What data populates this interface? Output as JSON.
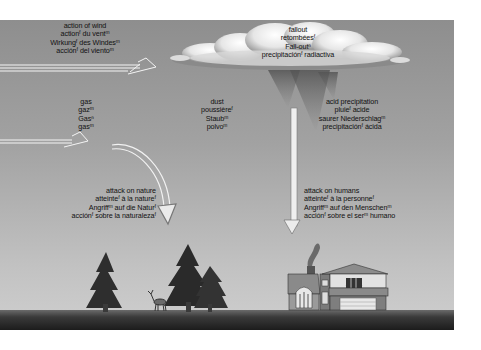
{
  "scene": {
    "colors": {
      "sky_top": "#8e8e8e",
      "sky_bottom": "#cbcbcb",
      "ground": "#2b2b2b",
      "text": "#111111"
    }
  },
  "labels": {
    "action_of_wind": [
      "action of wind",
      "actionᶠ du ventᵐ",
      "Wirkungᶠ des Windesᵐ",
      "acciónᶠ del vientoᵐ"
    ],
    "fallout": [
      "fallout",
      "retombéesᶠ",
      "Fall-outⁿ",
      "precipitaciónᶠ radiactiva"
    ],
    "gas": [
      "gas",
      "gazᵐ",
      "Gasⁿ",
      "gasᵐ"
    ],
    "dust": [
      "dust",
      "poussièreᶠ",
      "Staubᵐ",
      "polvoᵐ"
    ],
    "acid_precipitation": [
      "acid precipitation",
      "pluieᶠ acide",
      "saurer Niederschlagᵐ",
      "precipitaciónᶠ ácida"
    ],
    "attack_on_nature": [
      "attack on nature",
      "atteinteᶠ à la natureᶠ",
      "Angriffᵐ auf die Naturᶠ",
      "acciónᶠ sobre la naturalezaᶠ"
    ],
    "attack_on_humans": [
      "attack on humans",
      "atteinteᶠ à la personneᶠ",
      "Angriffᵐ auf den Menschenᵐ",
      "acciónᶠ sobre el serᵐ humano"
    ]
  }
}
